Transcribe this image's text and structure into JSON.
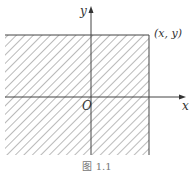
{
  "figure": {
    "axis_x_label": "x",
    "axis_y_label": "y",
    "origin_label": "O",
    "point_label": "(x, y)",
    "caption": "图 1.1",
    "region": "shaded quadrant region: all points with coordinates ≤ (x, y)",
    "colors": {
      "line": "#444444",
      "hatch": "#555555",
      "background": "#ffffff"
    }
  }
}
